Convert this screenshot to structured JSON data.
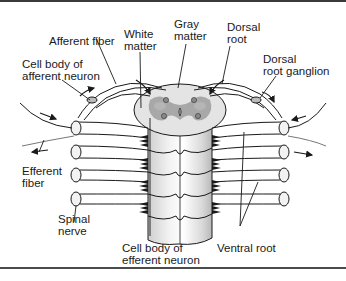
{
  "labels": {
    "afferent_fiber": "Afferent fiber",
    "white_matter": "White\nmatter",
    "gray_matter": "Gray\nmatter",
    "dorsal_root": "Dorsal\nroot",
    "dorsal_root_ganglion": "Dorsal\nroot ganglion",
    "cell_body_afferent": "Cell body of\nafferent neuron",
    "efferent_fiber": "Efferent\nfiber",
    "spinal_nerve": "Spinal\nnerve",
    "cell_body_efferent": "Cell body of\nefferent neuron",
    "ventral_root": "Ventral root"
  },
  "colors": {
    "white_matter": "#e4e4e4",
    "gray_matter": "#a8a8a8",
    "outline": "#1a1a1a",
    "nerve_fill": "#f2f2f2"
  }
}
